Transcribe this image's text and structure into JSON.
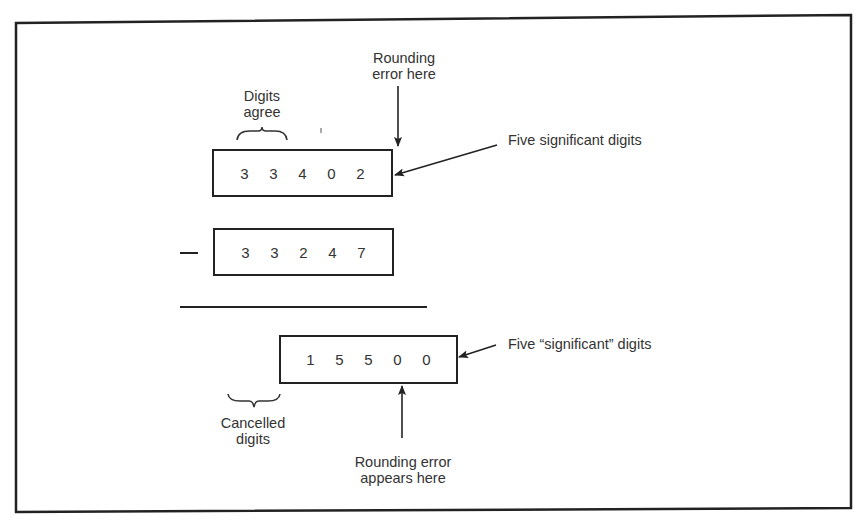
{
  "diagram": {
    "type": "subtraction-cancellation-illustration",
    "labels": {
      "digits_agree": [
        "Digits",
        "agree"
      ],
      "rounding_error_here": [
        "Rounding",
        "error here"
      ],
      "five_significant": "Five significant digits",
      "five_significant_quoted": "Five “significant” digits",
      "cancelled_digits": [
        "Cancelled",
        "digits"
      ],
      "rounding_error_appears": [
        "Rounding error",
        "appears here"
      ]
    },
    "operator": "—",
    "minuend": {
      "digits": [
        "3",
        "3",
        "4",
        "0",
        "2"
      ]
    },
    "subtrahend": {
      "digits": [
        "3",
        "3",
        "2",
        "4",
        "7"
      ]
    },
    "result": {
      "digits": [
        "1",
        "5",
        "5",
        "0",
        "0"
      ]
    },
    "colors": {
      "ink": "#222222",
      "text": "#333333",
      "background": "#ffffff"
    }
  }
}
